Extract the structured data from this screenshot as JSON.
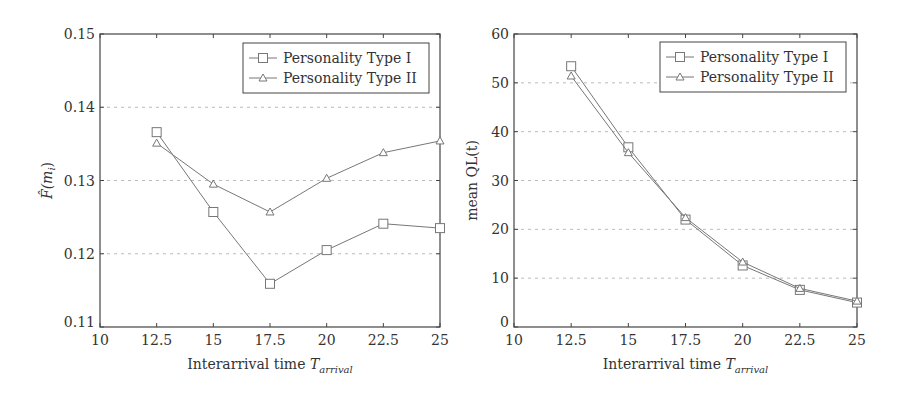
{
  "chart_data": [
    {
      "type": "line",
      "title": "",
      "xlabel": "Interarrival time T_arrival",
      "xlabel_main": "Interarrival time ",
      "xlabel_sym": "T",
      "xlabel_sub": "arrival",
      "ylabel": "F̂(m_i)",
      "ylabel_main": "F̂(m",
      "ylabel_sub": "i",
      "ylabel_close": ")",
      "x": [
        12.5,
        15,
        17.5,
        20,
        22.5,
        25
      ],
      "xlim": [
        10,
        25
      ],
      "ylim": [
        0.11,
        0.15
      ],
      "xticks": [
        "10",
        "12.5",
        "15",
        "17.5",
        "20",
        "22.5",
        "25"
      ],
      "yticks": [
        "0.11",
        "0.12",
        "0.13",
        "0.14",
        "0.15"
      ],
      "grid": "horizontal dashed",
      "legend_position": "upper right",
      "series": [
        {
          "name": "Personality Type I",
          "marker": "square",
          "values": [
            0.1366,
            0.1257,
            0.1159,
            0.1205,
            0.1241,
            0.1235
          ]
        },
        {
          "name": "Personality Type II",
          "marker": "triangle",
          "values": [
            0.1351,
            0.1295,
            0.1257,
            0.1303,
            0.1338,
            0.1354
          ]
        }
      ]
    },
    {
      "type": "line",
      "title": "",
      "xlabel": "Interarrival time T_arrival",
      "xlabel_main": "Interarrival time ",
      "xlabel_sym": "T",
      "xlabel_sub": "arrival",
      "ylabel": "mean QL(t)",
      "x": [
        12.5,
        15,
        17.5,
        20,
        22.5,
        25
      ],
      "xlim": [
        10,
        25
      ],
      "ylim": [
        0,
        60
      ],
      "xticks": [
        "10",
        "12.5",
        "15",
        "17.5",
        "20",
        "22.5",
        "25"
      ],
      "yticks": [
        "0",
        "10",
        "20",
        "30",
        "40",
        "50",
        "60"
      ],
      "grid": "horizontal dashed",
      "legend_position": "upper right",
      "series": [
        {
          "name": "Personality Type I",
          "marker": "square",
          "values": [
            53.4,
            36.8,
            22.0,
            12.6,
            7.6,
            5.0
          ]
        },
        {
          "name": "Personality Type II",
          "marker": "triangle",
          "values": [
            51.4,
            35.7,
            22.4,
            13.3,
            7.9,
            5.3
          ]
        }
      ]
    }
  ],
  "colors": {
    "axis": "#444444",
    "line": "#777777",
    "grid": "#bbbbbb",
    "text": "#333333"
  }
}
